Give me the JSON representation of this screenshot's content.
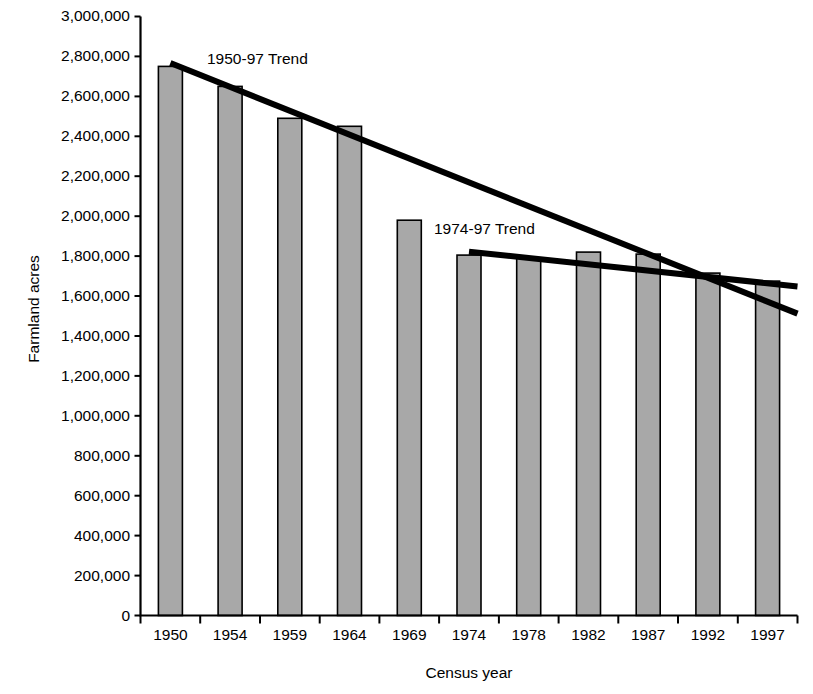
{
  "chart_data": {
    "type": "bar",
    "title": "",
    "xlabel": "Census year",
    "ylabel": "Farmland acres",
    "categories": [
      "1950",
      "1954",
      "1959",
      "1964",
      "1969",
      "1974",
      "1978",
      "1982",
      "1987",
      "1992",
      "1997"
    ],
    "values": [
      2750000,
      2650000,
      2490000,
      2450000,
      1980000,
      1805000,
      1790000,
      1820000,
      1810000,
      1715000,
      1675000
    ],
    "series": [
      {
        "name": "Farmland acres",
        "type": "bar",
        "values": [
          2750000,
          2650000,
          2490000,
          2450000,
          1980000,
          1805000,
          1790000,
          1820000,
          1810000,
          1715000,
          1675000
        ]
      },
      {
        "name": "1950-97 Trend",
        "type": "line",
        "start_category": "1950",
        "end_category": "1997",
        "start_value": 2767000,
        "end_value": 1512000
      },
      {
        "name": "1974-97 Trend",
        "type": "line",
        "start_category": "1974",
        "end_category": "1997",
        "start_value": 1822000,
        "end_value": 1648000
      }
    ],
    "annotations": [
      {
        "text": "1950-97 Trend",
        "x_px": 207,
        "y_px": 58
      },
      {
        "text": "1974-97 Trend",
        "x_px": 434,
        "y_px": 228
      }
    ],
    "ylim": [
      0,
      3000000
    ],
    "ytick_step": 200000,
    "ytick_labels": [
      "3,000,000",
      "2,800,000",
      "2,600,000",
      "2,400,000",
      "2,200,000",
      "2,000,000",
      "1,800,000",
      "1,600,000",
      "1,400,000",
      "1,200,000",
      "1,000,000",
      "800,000",
      "600,000",
      "400,000",
      "200,000",
      "0"
    ],
    "grid": false,
    "legend": "none",
    "colors": {
      "bar_fill": "#a8a8a8",
      "bar_stroke": "#000000",
      "axis": "#000000",
      "trend_line": "#000000",
      "background": "#ffffff"
    }
  }
}
